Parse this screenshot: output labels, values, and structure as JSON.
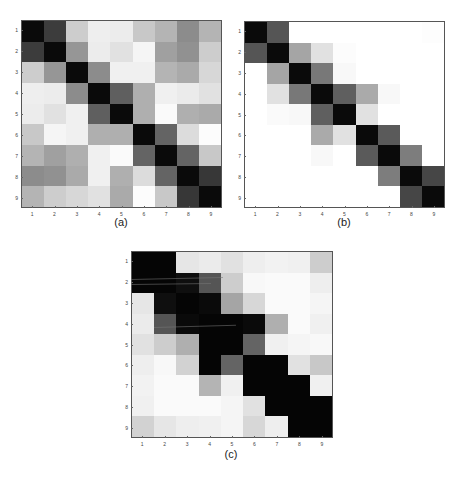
{
  "chart_data": [
    {
      "type": "heatmap",
      "title": "(a)",
      "caption": "(a)",
      "colormap": "gray (0=black high value, 255=white low value)",
      "x_tick_labels": [
        "1",
        "2",
        "3",
        "4",
        "5",
        "6",
        "7",
        "8",
        "9"
      ],
      "y_tick_labels": [
        "1",
        "2",
        "3",
        "4",
        "5",
        "6",
        "7",
        "8",
        "9"
      ],
      "gray_levels": [
        [
          10,
          60,
          205,
          238,
          236,
          200,
          180,
          140,
          180
        ],
        [
          60,
          10,
          150,
          236,
          225,
          245,
          160,
          145,
          205
        ],
        [
          205,
          150,
          10,
          140,
          240,
          240,
          180,
          170,
          215
        ],
        [
          238,
          236,
          140,
          10,
          95,
          175,
          240,
          235,
          225
        ],
        [
          236,
          225,
          240,
          95,
          10,
          175,
          250,
          175,
          170
        ],
        [
          200,
          245,
          240,
          175,
          175,
          10,
          100,
          220,
          252
        ],
        [
          180,
          160,
          175,
          240,
          250,
          100,
          10,
          100,
          200
        ],
        [
          140,
          145,
          170,
          240,
          175,
          220,
          100,
          10,
          55
        ],
        [
          180,
          205,
          215,
          225,
          170,
          252,
          200,
          55,
          10
        ]
      ]
    },
    {
      "type": "heatmap",
      "title": "(b)",
      "caption": "(b)",
      "colormap": "gray (0=black high value, 255=white low value)",
      "x_tick_labels": [
        "1",
        "2",
        "3",
        "4",
        "5",
        "6",
        "7",
        "8",
        "9"
      ],
      "y_tick_labels": [
        "1",
        "2",
        "3",
        "4",
        "5",
        "6",
        "7",
        "8",
        "9"
      ],
      "gray_levels": [
        [
          10,
          85,
          255,
          255,
          255,
          255,
          255,
          255,
          253
        ],
        [
          85,
          10,
          165,
          225,
          252,
          255,
          255,
          255,
          255
        ],
        [
          255,
          165,
          10,
          120,
          248,
          255,
          255,
          255,
          255
        ],
        [
          255,
          225,
          120,
          10,
          95,
          170,
          248,
          255,
          255
        ],
        [
          255,
          250,
          248,
          95,
          10,
          225,
          255,
          255,
          255
        ],
        [
          255,
          255,
          255,
          170,
          225,
          10,
          90,
          255,
          255
        ],
        [
          255,
          255,
          255,
          248,
          255,
          90,
          10,
          125,
          255
        ],
        [
          255,
          255,
          255,
          255,
          255,
          255,
          125,
          10,
          70
        ],
        [
          255,
          255,
          255,
          255,
          255,
          255,
          255,
          70,
          10
        ]
      ]
    },
    {
      "type": "heatmap",
      "title": "(c)",
      "caption": "(c)",
      "colormap": "gray (0=black high value, 255=white low value)",
      "x_tick_labels": [
        "1",
        "2",
        "3",
        "4",
        "5",
        "6",
        "7",
        "8",
        "9"
      ],
      "y_tick_labels": [
        "1",
        "2",
        "3",
        "4",
        "5",
        "6",
        "7",
        "8",
        "9"
      ],
      "gray_levels": [
        [
          5,
          5,
          230,
          235,
          225,
          238,
          242,
          240,
          205
        ],
        [
          5,
          5,
          15,
          85,
          205,
          248,
          250,
          250,
          238
        ],
        [
          230,
          15,
          5,
          10,
          165,
          215,
          250,
          250,
          245
        ],
        [
          235,
          85,
          10,
          5,
          5,
          10,
          175,
          250,
          240
        ],
        [
          225,
          205,
          175,
          5,
          5,
          100,
          240,
          245,
          248
        ],
        [
          238,
          248,
          210,
          5,
          100,
          5,
          5,
          225,
          200
        ],
        [
          242,
          250,
          250,
          180,
          240,
          5,
          5,
          5,
          240
        ],
        [
          240,
          250,
          250,
          250,
          245,
          225,
          5,
          5,
          5
        ],
        [
          210,
          230,
          238,
          240,
          245,
          215,
          238,
          5,
          5
        ]
      ]
    }
  ],
  "captions": {
    "a": "(a)",
    "b": "(b)",
    "c": "(c)"
  }
}
